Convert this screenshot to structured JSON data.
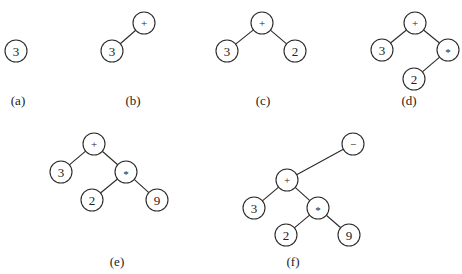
{
  "figure": {
    "style": {
      "stroke_color": "#2a2a2a",
      "text_color": "#222222",
      "background": "#ffffff",
      "node_radius": 11
    },
    "panels": [
      {
        "id": "a",
        "caption": "(a)",
        "caption_pos": [
          18,
          100
        ],
        "nodes": [
          {
            "id": "n3",
            "label": "3",
            "x": 16,
            "y": 51
          }
        ],
        "edges": []
      },
      {
        "id": "b",
        "caption": "(b)",
        "caption_pos": [
          133,
          100
        ],
        "nodes": [
          {
            "id": "plus",
            "label": "+",
            "x": 144,
            "y": 23
          },
          {
            "id": "n3",
            "label": "3",
            "x": 112,
            "y": 51
          }
        ],
        "edges": [
          [
            "plus",
            "n3"
          ]
        ]
      },
      {
        "id": "c",
        "caption": "(c)",
        "caption_pos": [
          263,
          100
        ],
        "nodes": [
          {
            "id": "plus",
            "label": "+",
            "x": 262,
            "y": 23
          },
          {
            "id": "n3",
            "label": "3",
            "x": 227,
            "y": 51
          },
          {
            "id": "n2",
            "label": "2",
            "x": 295,
            "y": 51
          }
        ],
        "edges": [
          [
            "plus",
            "n3"
          ],
          [
            "plus",
            "n2"
          ]
        ]
      },
      {
        "id": "d",
        "caption": "(d)",
        "caption_pos": [
          409,
          100
        ],
        "nodes": [
          {
            "id": "plus",
            "label": "+",
            "x": 415,
            "y": 23
          },
          {
            "id": "n3",
            "label": "3",
            "x": 382,
            "y": 50
          },
          {
            "id": "mul",
            "label": "*",
            "x": 448,
            "y": 50
          },
          {
            "id": "n2",
            "label": "2",
            "x": 414,
            "y": 79
          }
        ],
        "edges": [
          [
            "plus",
            "n3"
          ],
          [
            "plus",
            "mul"
          ],
          [
            "mul",
            "n2"
          ]
        ]
      },
      {
        "id": "e",
        "caption": "(e)",
        "caption_pos": [
          117,
          261
        ],
        "nodes": [
          {
            "id": "plus",
            "label": "+",
            "x": 94,
            "y": 144
          },
          {
            "id": "n3",
            "label": "3",
            "x": 61,
            "y": 172
          },
          {
            "id": "mul",
            "label": "*",
            "x": 126,
            "y": 172
          },
          {
            "id": "n2",
            "label": "2",
            "x": 92,
            "y": 200
          },
          {
            "id": "n9",
            "label": "9",
            "x": 157,
            "y": 200
          }
        ],
        "edges": [
          [
            "plus",
            "n3"
          ],
          [
            "plus",
            "mul"
          ],
          [
            "mul",
            "n2"
          ],
          [
            "mul",
            "n9"
          ]
        ]
      },
      {
        "id": "f",
        "caption": "(f)",
        "caption_pos": [
          293,
          261
        ],
        "nodes": [
          {
            "id": "minus",
            "label": "−",
            "x": 353,
            "y": 144
          },
          {
            "id": "plus",
            "label": "+",
            "x": 287,
            "y": 180
          },
          {
            "id": "n3",
            "label": "3",
            "x": 254,
            "y": 208
          },
          {
            "id": "mul",
            "label": "*",
            "x": 318,
            "y": 208
          },
          {
            "id": "n2",
            "label": "2",
            "x": 286,
            "y": 235
          },
          {
            "id": "n9",
            "label": "9",
            "x": 349,
            "y": 235
          }
        ],
        "edges": [
          [
            "minus",
            "plus"
          ],
          [
            "plus",
            "n3"
          ],
          [
            "plus",
            "mul"
          ],
          [
            "mul",
            "n2"
          ],
          [
            "mul",
            "n9"
          ]
        ]
      }
    ]
  }
}
